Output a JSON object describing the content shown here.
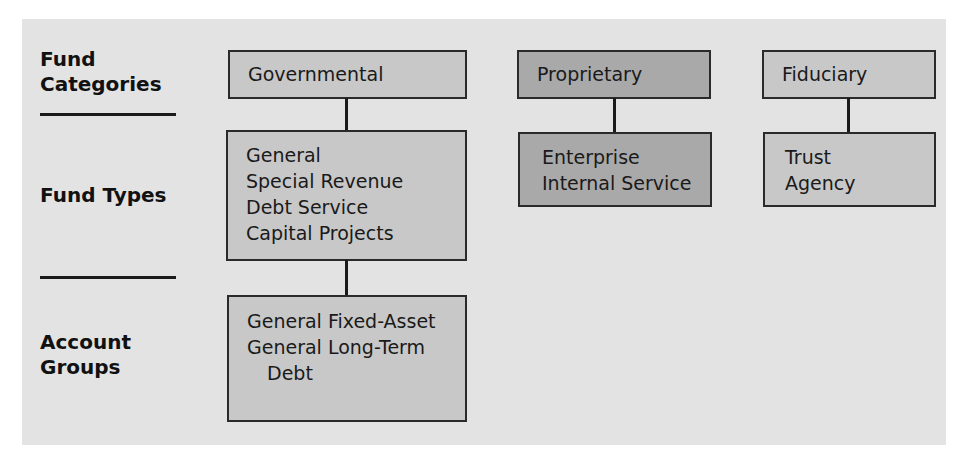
{
  "row_labels": {
    "categories": [
      "Fund",
      "Categories"
    ],
    "types": [
      "Fund Types"
    ],
    "groups": [
      "Account",
      "Groups"
    ]
  },
  "columns": [
    {
      "category": "Governmental",
      "fund_types": [
        "General",
        "Special Revenue",
        "Debt Service",
        "Capital Projects"
      ],
      "account_groups": [
        "General Fixed-Asset",
        "General Long-Term",
        "Debt"
      ]
    },
    {
      "category": "Proprietary",
      "fund_types": [
        "Enterprise",
        "Internal Service"
      ]
    },
    {
      "category": "Fiduciary",
      "fund_types": [
        "Trust",
        "Agency"
      ]
    }
  ],
  "colors": {
    "background": "#e3e3e3",
    "governmental_fill": "#c8c8c8",
    "proprietary_fill": "#a9a9a9",
    "fiduciary_fill": "#c8c8c8",
    "border": "#2a2a2a"
  }
}
